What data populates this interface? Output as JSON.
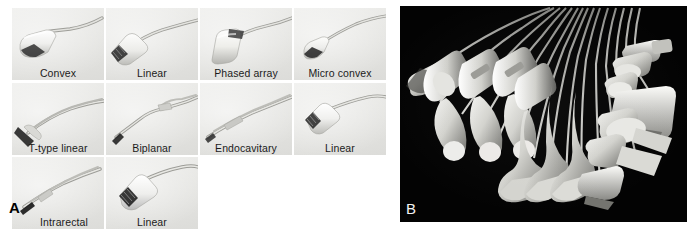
{
  "figure": {
    "panels": [
      {
        "id": "A",
        "label": "A",
        "kind": "grid-of-photographs",
        "background": "#ffffff",
        "tile_background": "#e8e8e6",
        "caption_color": "#1b1b1b",
        "rows": [
          {
            "items": [
              {
                "caption": "Convex",
                "probe": "convex"
              },
              {
                "caption": "Linear",
                "probe": "linear"
              },
              {
                "caption": "Phased array",
                "probe": "phased-array"
              },
              {
                "caption": "Micro convex",
                "probe": "micro-convex"
              }
            ]
          },
          {
            "items": [
              {
                "caption": "T-type linear",
                "probe": "t-type-linear"
              },
              {
                "caption": "Biplanar",
                "probe": "biplanar"
              },
              {
                "caption": "Endocavitary",
                "probe": "endocavitary"
              },
              {
                "caption": "Linear",
                "probe": "linear-wide"
              }
            ]
          },
          {
            "items": [
              {
                "caption": "Intrarectal",
                "probe": "intrarectal"
              },
              {
                "caption": "Linear",
                "probe": "linear-t"
              }
            ]
          }
        ]
      },
      {
        "id": "B",
        "label": "B",
        "kind": "photograph",
        "background": "#030303",
        "label_color": "#f2f2f2",
        "description": "Dark studio photograph of a fanned array of ultrasound transducers with their cables radiating to the upper right"
      }
    ]
  }
}
